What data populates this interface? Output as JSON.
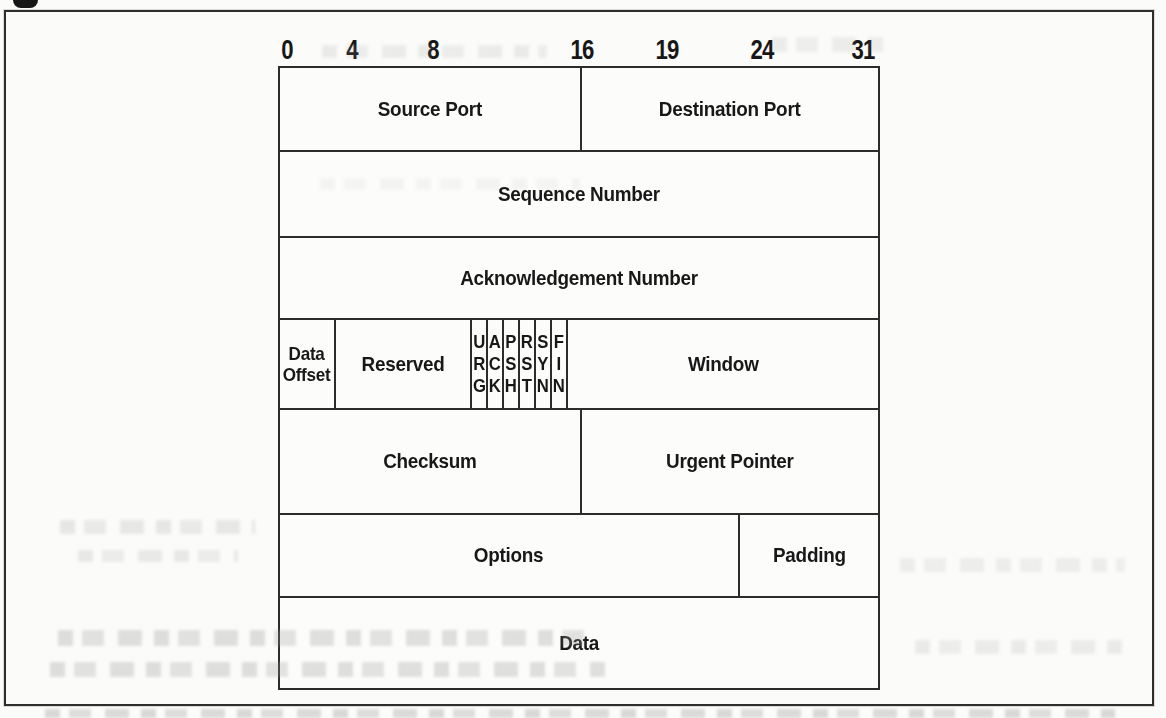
{
  "colors": {
    "paper": "#fbfbf9",
    "ink": "#1a1a1a",
    "table_line": "#2c2c2c",
    "frame_line": "#2e2e2e"
  },
  "bit_ruler": {
    "ticks": [
      "0",
      "4",
      "8",
      "16",
      "19",
      "24",
      "31"
    ]
  },
  "tcp_header": {
    "row1": {
      "left": "Source Port",
      "right": "Destination Port"
    },
    "row2": {
      "label": "Sequence Number"
    },
    "row3": {
      "label": "Acknowledgement Number"
    },
    "row4": {
      "data_offset": "Data\nOffset",
      "reserved": "Reserved",
      "flags": [
        "U\nR\nG",
        "A\nC\nK",
        "P\nS\nH",
        "R\nS\nT",
        "S\nY\nN",
        "F\nI\nN"
      ],
      "window": "Window"
    },
    "row5": {
      "left": "Checksum",
      "right": "Urgent Pointer"
    },
    "row6": {
      "left": "Options",
      "right": "Padding"
    },
    "row7": {
      "label": "Data"
    }
  }
}
